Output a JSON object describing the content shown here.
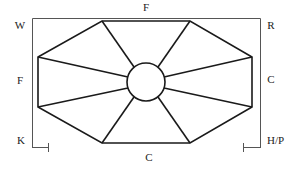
{
  "diagram": {
    "colors": {
      "stroke": "#1a1a1a",
      "frame": "#555555",
      "text": "#222222",
      "background": "#ffffff"
    },
    "labels": {
      "top": "F",
      "top_left": "W",
      "top_right": "R",
      "left": "F",
      "right": "C",
      "bottom_left": "K",
      "bottom_right": "H/P",
      "bottom": "C"
    }
  }
}
